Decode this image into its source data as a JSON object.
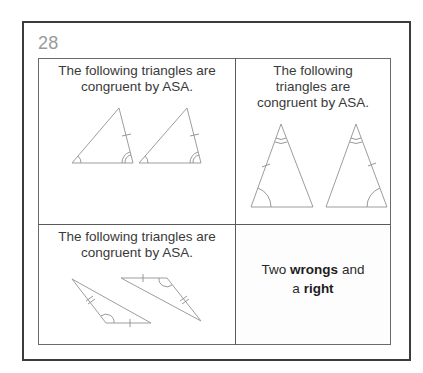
{
  "card": {
    "number": "28"
  },
  "cells": [
    {
      "position": "top-left",
      "prompt": "The following triangles are congruent by ASA.",
      "figure": "two-triangles-side-by-side-angle-side-angle"
    },
    {
      "position": "top-right",
      "prompt_lines": [
        "The following",
        "triangles are",
        "congruent by ASA."
      ],
      "figure": "two-isosceles-triangles-apex-angle-side-base-angle"
    },
    {
      "position": "bottom-left",
      "prompt": "The following triangles are congruent by ASA.",
      "figure": "two-rotated-obtuse-triangles-side-angle-side"
    },
    {
      "position": "bottom-right",
      "answer": {
        "part1": "Two ",
        "bold1": "wrongs",
        "part2": " and",
        "part3": "a ",
        "bold2": "right"
      }
    }
  ],
  "colors": {
    "frame": "#3c3c3c",
    "grid": "#5a5a5a",
    "number": "#9a9a9a",
    "text": "#3a3a3a",
    "figure_stroke": "#9d9d9d"
  }
}
